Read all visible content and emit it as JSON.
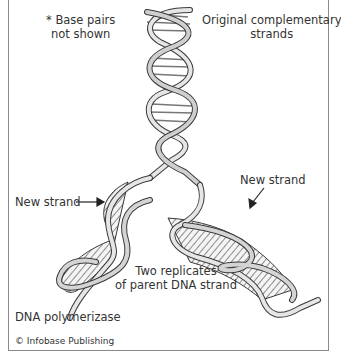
{
  "labels": {
    "base_pairs_line1": "* Base pairs",
    "base_pairs_line2": "not shown",
    "original_line1": "Original complementary",
    "original_line2": "strands",
    "new_strand_left": "New strand",
    "new_strand_right": "New strand",
    "replicates_line1": "Two replicates",
    "replicates_line2": "of parent DNA strand",
    "polymerase": "DNA polymerizase",
    "copyright": "© Infobase Publishing"
  },
  "colors": {
    "ribbon_light": "#e6e6e6",
    "ribbon_dark": "#6e6e6e",
    "outline": "#3a3a3a",
    "text": "#333333",
    "frame": "#8a8a8a"
  }
}
